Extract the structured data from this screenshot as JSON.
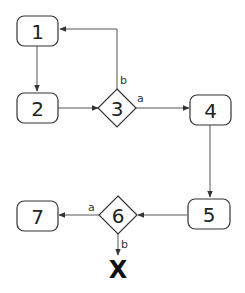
{
  "diagram": {
    "type": "flowchart",
    "nodes": [
      {
        "id": "1",
        "label": "1",
        "shape": "rounded-rect"
      },
      {
        "id": "2",
        "label": "2",
        "shape": "rounded-rect"
      },
      {
        "id": "3",
        "label": "3",
        "shape": "diamond"
      },
      {
        "id": "4",
        "label": "4",
        "shape": "rounded-rect"
      },
      {
        "id": "5",
        "label": "5",
        "shape": "rounded-rect"
      },
      {
        "id": "6",
        "label": "6",
        "shape": "diamond"
      },
      {
        "id": "7",
        "label": "7",
        "shape": "rounded-rect"
      },
      {
        "id": "end",
        "label": "X",
        "shape": "terminal"
      }
    ],
    "edges": [
      {
        "from": "1",
        "to": "2",
        "label": ""
      },
      {
        "from": "2",
        "to": "3",
        "label": ""
      },
      {
        "from": "3",
        "to": "4",
        "label": "a"
      },
      {
        "from": "3",
        "to": "1",
        "label": "b"
      },
      {
        "from": "4",
        "to": "5",
        "label": ""
      },
      {
        "from": "5",
        "to": "6",
        "label": ""
      },
      {
        "from": "6",
        "to": "7",
        "label": "a"
      },
      {
        "from": "6",
        "to": "end",
        "label": "b"
      }
    ]
  }
}
